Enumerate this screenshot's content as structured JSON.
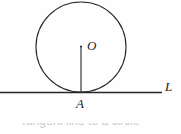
{
  "figure": {
    "background_color": "#fefefe",
    "stroke_color": "#262626",
    "labels": {
      "center": "O",
      "tangent_point": "A",
      "line": "L"
    },
    "geometry": {
      "circle": {
        "cx": 81,
        "cy": 47,
        "r": 45,
        "stroke_width": 1.1
      },
      "tangent_line": {
        "x1": 0,
        "y1": 92.5,
        "x2": 162,
        "y2": 92.5,
        "stroke_width": 1.6
      },
      "radius_segment": {
        "x1": 81,
        "y1": 46,
        "x2": 81,
        "y2": 92,
        "stroke_width": 1.1
      }
    }
  },
  "caption": {
    "text": "Tangent line to a circle"
  }
}
